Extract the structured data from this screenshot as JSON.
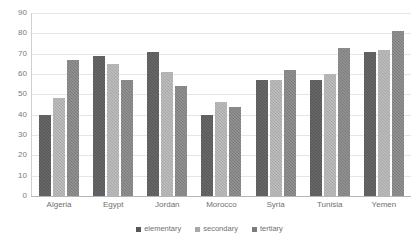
{
  "chart_data": {
    "type": "bar",
    "title": "",
    "subtitle": "",
    "xlabel": "",
    "ylabel": "",
    "ylim": [
      0,
      90
    ],
    "ytick_step": 10,
    "yticks": [
      0,
      10,
      20,
      30,
      40,
      50,
      60,
      70,
      80,
      90
    ],
    "grid": true,
    "legend_position": "bottom",
    "categories": [
      "Algeria",
      "Egypt",
      "Jordan",
      "Morocco",
      "Syria",
      "Tunisia",
      "Yemen"
    ],
    "series": [
      {
        "name": "elementary",
        "color": "#565656",
        "values": [
          40,
          69,
          71,
          40,
          57,
          57,
          71
        ]
      },
      {
        "name": "secondary",
        "color": "#a8a8a8",
        "values": [
          48,
          65,
          61,
          46,
          57,
          60,
          72
        ]
      },
      {
        "name": "tertiary",
        "color": "#7b7b7b",
        "values": [
          67,
          57,
          54,
          44,
          62,
          73,
          81
        ]
      }
    ]
  },
  "legend": {
    "items": [
      {
        "label": "elementary"
      },
      {
        "label": "secondary"
      },
      {
        "label": "tertiary"
      }
    ]
  }
}
